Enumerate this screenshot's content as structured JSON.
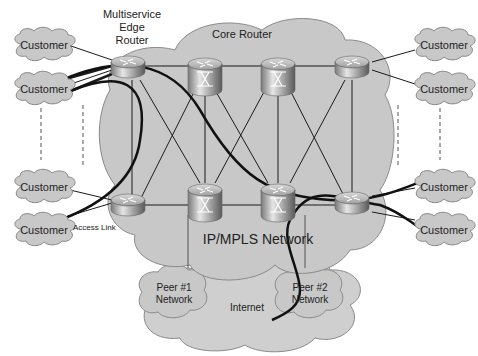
{
  "diagram": {
    "title_labels": {
      "edge_router": [
        "Multiservice",
        "Edge",
        "Router"
      ],
      "core_router": "Core Router",
      "network": "IP/MPLS Network",
      "access_link": "Access Link",
      "internet": "Internet",
      "peer1": [
        "Peer #1",
        "Network"
      ],
      "peer2": [
        "Peer #2",
        "Network"
      ]
    },
    "customers": [
      {
        "id": "c1",
        "label": "Customer",
        "side": "left"
      },
      {
        "id": "c2",
        "label": "Customer",
        "side": "left"
      },
      {
        "id": "c3",
        "label": "Customer",
        "side": "left"
      },
      {
        "id": "c4",
        "label": "Customer",
        "side": "left"
      },
      {
        "id": "c5",
        "label": "Customer",
        "side": "right"
      },
      {
        "id": "c6",
        "label": "Customer",
        "side": "right"
      },
      {
        "id": "c7",
        "label": "Customer",
        "side": "right"
      },
      {
        "id": "c8",
        "label": "Customer",
        "side": "right"
      }
    ],
    "routers": [
      {
        "id": "edge-top-left",
        "type": "edge"
      },
      {
        "id": "core-top-1",
        "type": "core"
      },
      {
        "id": "core-top-2",
        "type": "core"
      },
      {
        "id": "edge-top-right",
        "type": "edge"
      },
      {
        "id": "edge-bottom-left",
        "type": "edge"
      },
      {
        "id": "core-bottom-1",
        "type": "core"
      },
      {
        "id": "core-bottom-2",
        "type": "core"
      },
      {
        "id": "edge-bottom-right",
        "type": "edge"
      }
    ],
    "colors": {
      "cloud_fill": "#c8c8c8",
      "cloud_stroke": "#8a8a8a",
      "router_body": "#a8a8a8",
      "link": "#1a1a1a"
    }
  }
}
